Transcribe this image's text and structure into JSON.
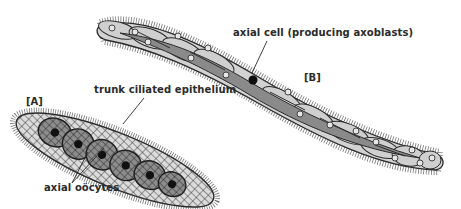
{
  "figure": {
    "panels": [
      {
        "id": "A",
        "tag": "[A]"
      },
      {
        "id": "B",
        "tag": "[B]"
      }
    ],
    "labels": {
      "trunk_epithelium": "trunk ciliated epithelium",
      "axial_oocytes": "axial oöcytes",
      "axial_cell": "axial cell (producing axoblasts)"
    },
    "colors": {
      "outline": "#2b2b2b",
      "epithelium_light": "#d6d6d6",
      "epithelium_mid": "#a8a8a8",
      "axial_dark": "#7a7a7a",
      "nucleus": "#111111",
      "cilia": "#555555"
    }
  }
}
